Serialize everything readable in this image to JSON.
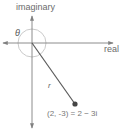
{
  "diagram": {
    "type": "complex-plane",
    "axes": {
      "horizontal_label": "real",
      "vertical_label": "imaginary"
    },
    "angle_label": "θ",
    "modulus_label": "r",
    "point": {
      "coords": "(2, -3)",
      "label": "(2, -3) = 2 − 3i"
    },
    "colors": {
      "axis": "#808080",
      "segment": "#555555",
      "point": "#444444",
      "arc": "#bdbdbd",
      "text": "#6b6b6b"
    }
  }
}
